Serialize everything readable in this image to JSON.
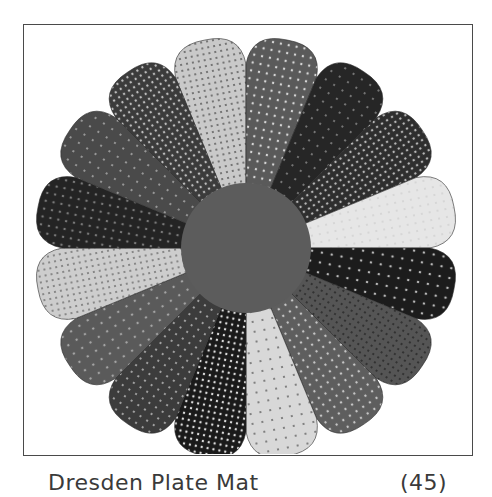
{
  "figure": {
    "center": {
      "label": "center-circle",
      "color": "#5c5c5c"
    },
    "petal_count": 16,
    "petals": [
      {
        "name": "light-confetti-print",
        "color": "#c9c9c9",
        "pattern": "#4d4d4d"
      },
      {
        "name": "medium-dot-stripe",
        "color": "#5a5a5a",
        "pattern": "#d8d8d8"
      },
      {
        "name": "dark-floral",
        "color": "#262626",
        "pattern": "#9a9a9a"
      },
      {
        "name": "dark-floral-2",
        "color": "#2e2e2e",
        "pattern": "#b8b8b8"
      },
      {
        "name": "light-gingham",
        "color": "#e6e6e6",
        "pattern": "#cfcfcf"
      },
      {
        "name": "black-floral",
        "color": "#1c1c1c",
        "pattern": "#bdbdbd"
      },
      {
        "name": "medium-speckle",
        "color": "#555555",
        "pattern": "#202020"
      },
      {
        "name": "medium-dot",
        "color": "#5e5e5e",
        "pattern": "#c8c8c8"
      },
      {
        "name": "light-vine-floral",
        "color": "#d8d8d8",
        "pattern": "#555555"
      },
      {
        "name": "black-dots",
        "color": "#1a1a1a",
        "pattern": "#e0e0e0"
      },
      {
        "name": "diagonal-stripe-dots",
        "color": "#3c3c3c",
        "pattern": "#d0d0d0"
      },
      {
        "name": "medium-mottled-floral",
        "color": "#5a5a5a",
        "pattern": "#a5a5a5"
      },
      {
        "name": "light-floral",
        "color": "#cdcdcd",
        "pattern": "#666666"
      },
      {
        "name": "dark-leaf-print",
        "color": "#242424",
        "pattern": "#7a7a7a"
      },
      {
        "name": "medium-flower-dots",
        "color": "#4a4a4a",
        "pattern": "#bcbcbc"
      },
      {
        "name": "dark-sparse-dots",
        "color": "#3b3b3b",
        "pattern": "#bfbfbf"
      }
    ]
  },
  "caption": {
    "title": "Dresden Plate Mat",
    "number": "(45)"
  }
}
